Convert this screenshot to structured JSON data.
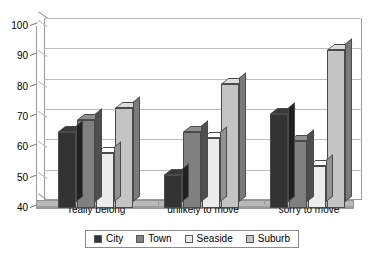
{
  "chart_data": {
    "type": "bar",
    "title": "",
    "subtitle": "",
    "xlabel": "",
    "ylabel": "",
    "categories": [
      "really belong",
      "unlikely to move",
      "sorry to move"
    ],
    "series": [
      {
        "name": "City",
        "values": [
          65,
          51,
          71
        ],
        "color": "#333333"
      },
      {
        "name": "Town",
        "values": [
          69,
          65,
          62
        ],
        "color": "#808080"
      },
      {
        "name": "Seaside",
        "values": [
          58,
          63,
          54
        ],
        "color": "#ececec"
      },
      {
        "name": "Suburb",
        "values": [
          73,
          81,
          92
        ],
        "color": "#c4c4c4"
      }
    ],
    "ylim": [
      40,
      100
    ],
    "yticks": [
      40,
      50,
      60,
      70,
      80,
      90,
      100
    ],
    "ytick_labels": [
      "40",
      "50",
      "60",
      "70",
      "80",
      "90",
      "100"
    ],
    "grid": true,
    "legend_position": "bottom",
    "three_d": true
  },
  "legend": {
    "entries": [
      {
        "label": "City"
      },
      {
        "label": "Town"
      },
      {
        "label": "Seaside"
      },
      {
        "label": "Suburb"
      }
    ]
  }
}
